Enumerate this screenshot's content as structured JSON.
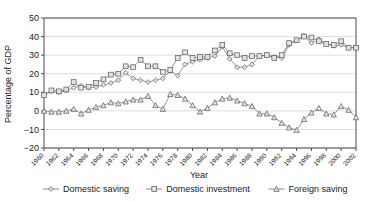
{
  "chart_data": {
    "type": "line",
    "title": "",
    "xlabel": "Year",
    "ylabel": "Percentage of GDP",
    "ylim": [
      -20,
      50
    ],
    "yticks": [
      -20,
      -10,
      0,
      10,
      20,
      30,
      40,
      50
    ],
    "ytick_labels": [
      "−20",
      "−10",
      "0",
      "10",
      "20",
      "30",
      "40",
      "50"
    ],
    "grid": true,
    "legend_position": "bottom",
    "x": [
      1960,
      1961,
      1962,
      1963,
      1964,
      1965,
      1966,
      1967,
      1968,
      1969,
      1970,
      1971,
      1972,
      1973,
      1974,
      1975,
      1976,
      1977,
      1978,
      1979,
      1980,
      1981,
      1982,
      1983,
      1984,
      1985,
      1986,
      1987,
      1988,
      1989,
      1990,
      1991,
      1992,
      1993,
      1994,
      1995,
      1996,
      1997,
      1998,
      1999,
      2000,
      2001,
      2002
    ],
    "xtick_labels": [
      "1960",
      "1962",
      "1964",
      "1966",
      "1968",
      "1970",
      "1972",
      "1974",
      "1976",
      "1978",
      "1980",
      "1982",
      "1984",
      "1986",
      "1988",
      "1990",
      "1992",
      "1994",
      "1996",
      "1998",
      "2000",
      "2002"
    ],
    "xtick_years": [
      1960,
      1962,
      1964,
      1966,
      1968,
      1970,
      1972,
      1974,
      1976,
      1978,
      1980,
      1982,
      1984,
      1986,
      1988,
      1990,
      1992,
      1994,
      1996,
      1998,
      2000,
      2002
    ],
    "series": [
      {
        "name": "Domestic saving",
        "marker": "diamond",
        "values": [
          8.5,
          10.5,
          10.0,
          11.0,
          12.5,
          13.5,
          12.5,
          12.8,
          14.0,
          15.0,
          16.5,
          20.5,
          17.5,
          16.5,
          15.5,
          16.5,
          17.5,
          21.5,
          19.0,
          25.0,
          26.5,
          27.5,
          28.5,
          29.5,
          34.5,
          28.0,
          23.5,
          23.5,
          25.0,
          29.5,
          30.0,
          29.0,
          28.5,
          35.5,
          38.0,
          40.5,
          36.5,
          38.5,
          36.0,
          35.0,
          35.5,
          34.0,
          34.0
        ]
      },
      {
        "name": "Domestic investment",
        "marker": "square",
        "values": [
          8.5,
          11.0,
          10.5,
          11.5,
          15.5,
          12.5,
          13.0,
          15.0,
          17.0,
          19.5,
          20.0,
          24.0,
          23.5,
          27.5,
          24.0,
          24.0,
          21.0,
          22.0,
          28.5,
          31.5,
          28.5,
          29.0,
          29.0,
          32.5,
          35.5,
          31.0,
          30.0,
          28.5,
          29.5,
          29.5,
          30.0,
          28.5,
          30.0,
          36.5,
          38.0,
          40.0,
          39.5,
          37.5,
          36.0,
          35.5,
          37.5,
          34.0,
          34.0
        ]
      },
      {
        "name": "Foreign saving",
        "marker": "triangle",
        "values": [
          0.0,
          -0.5,
          -0.5,
          0.0,
          1.0,
          -1.5,
          0.5,
          2.0,
          3.0,
          4.5,
          4.0,
          5.0,
          6.0,
          6.0,
          8.0,
          3.0,
          1.0,
          9.0,
          8.5,
          6.5,
          3.0,
          -0.5,
          1.5,
          4.5,
          6.5,
          7.0,
          5.5,
          4.0,
          2.5,
          -1.5,
          -1.5,
          -3.5,
          -6.5,
          -9.0,
          -10.3,
          -4.5,
          -1.0,
          1.5,
          -1.5,
          -2.0,
          2.5,
          0.5,
          -3.5
        ]
      }
    ]
  },
  "x_axis": {
    "title": "Year"
  },
  "y_axis": {
    "title": "Percentage of GDP"
  },
  "legend": {
    "items": [
      {
        "label": "Domestic saving",
        "marker": "diamond-marker-icon"
      },
      {
        "label": "Domestic investment",
        "marker": "square-marker-icon"
      },
      {
        "label": "Foreign saving",
        "marker": "triangle-marker-icon"
      }
    ]
  }
}
